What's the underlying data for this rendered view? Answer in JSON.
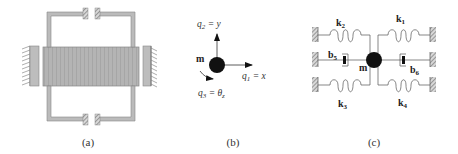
{
  "panels": {
    "a": {
      "caption": "(a)"
    },
    "b": {
      "caption": "(b)",
      "mass_label": "m",
      "q2_label": "q",
      "q2_sub": "2",
      "q2_eq": " = y",
      "q1_label": "q",
      "q1_sub": "1",
      "q1_eq": " = x",
      "q3_label": "q",
      "q3_sub": "3",
      "q3_eq": " = θ",
      "q3_eq_sub": "z"
    },
    "c": {
      "caption": "(c)",
      "mass_label": "m",
      "k1": "k",
      "k1_sub": "1",
      "k2": "k",
      "k2_sub": "2",
      "k3": "k",
      "k3_sub": "3",
      "k4": "k",
      "k4_sub": "4",
      "b5": "b",
      "b5_sub": "5",
      "b6": "b",
      "b6_sub": "6"
    }
  },
  "colors": {
    "mass": "#111111",
    "beam": "#b0b0b0",
    "frame": "#a8a8a8",
    "line": "#555555"
  }
}
